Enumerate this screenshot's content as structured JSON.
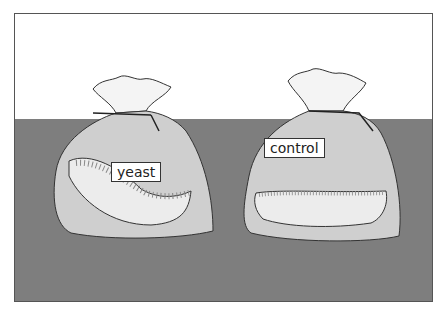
{
  "scene": {
    "description": "Two drawstring bags each containing a slice of bread on a table",
    "bags": [
      {
        "label": "yeast",
        "contents": "bread slice with dark spots"
      },
      {
        "label": "control",
        "contents": "bread slice"
      }
    ],
    "colors": {
      "wall": "#ffffff",
      "table": "#7e7e7e",
      "bag": "#cfcfcf",
      "bread": "#e6e6e6"
    }
  }
}
